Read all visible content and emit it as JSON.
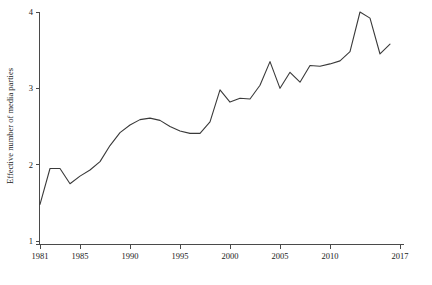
{
  "chart_data": {
    "type": "line",
    "title": "",
    "subtitle": "",
    "xlabel": "",
    "ylabel": "Effective number of media parties",
    "xlim": [
      1981,
      2017
    ],
    "ylim": [
      1,
      4
    ],
    "grid": false,
    "legend": "none",
    "x_ticks": [
      1981,
      1985,
      1990,
      1995,
      2000,
      2005,
      2010,
      2017
    ],
    "x_tick_labels": [
      "1981",
      "1985",
      "1990",
      "1995",
      "2000",
      "2005",
      "2010",
      "2017"
    ],
    "y_ticks": [
      1,
      2,
      3,
      4
    ],
    "y_tick_labels": [
      "1",
      "2",
      "3",
      "4"
    ],
    "line_color": "#3a3a3a",
    "axis_color": "#4a4a4a",
    "series": [
      {
        "name": "Effective number of media parties",
        "x": [
          1981,
          1982,
          1983,
          1984,
          1985,
          1986,
          1987,
          1988,
          1989,
          1990,
          1991,
          1992,
          1993,
          1994,
          1995,
          1996,
          1997,
          1998,
          1999,
          2000,
          2001,
          2002,
          2003,
          2004,
          2005,
          2006,
          2007,
          2008,
          2009,
          2010,
          2011,
          2012,
          2013,
          2014,
          2015,
          2016
        ],
        "values": [
          1.48,
          1.95,
          1.95,
          1.75,
          1.85,
          1.93,
          2.04,
          2.25,
          2.42,
          2.52,
          2.59,
          2.61,
          2.58,
          2.5,
          2.44,
          2.41,
          2.41,
          2.56,
          2.98,
          2.82,
          2.87,
          2.86,
          3.04,
          3.35,
          3.0,
          3.21,
          3.08,
          3.3,
          3.29,
          3.32,
          3.36,
          3.48,
          4.0,
          3.92,
          3.45,
          3.58
        ]
      }
    ]
  },
  "axes": {
    "y_title": "Effective number of media parties"
  }
}
